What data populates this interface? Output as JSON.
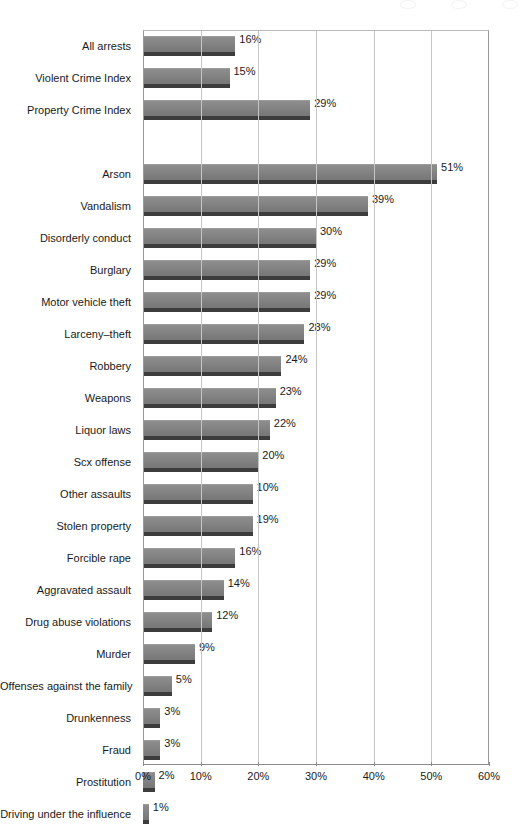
{
  "chart_data": {
    "type": "bar",
    "orientation": "horizontal",
    "title": "",
    "subtitle": "",
    "xlabel": "",
    "ylabel": "",
    "xlim": [
      0,
      60
    ],
    "xtick_labels": [
      "0%",
      "10%",
      "20%",
      "30%",
      "40%",
      "50%",
      "60%"
    ],
    "xtick_values": [
      0,
      10,
      20,
      30,
      40,
      50,
      60
    ],
    "grid": "vertical",
    "legend": "none",
    "series_name": "Percent of arrests involving juveniles",
    "bar_color": "#828282",
    "groups": [
      {
        "name": "summary",
        "categories": [
          "All arrests",
          "Violent Crime Index",
          "Property Crime Index"
        ],
        "values": [
          16,
          15,
          29
        ],
        "labels": [
          "16%",
          "15%",
          "29%"
        ]
      },
      {
        "name": "offenses",
        "categories": [
          "Arson",
          "Vandalism",
          "Disorderly conduct",
          "Burglary",
          "Motor vehicle theft",
          "Larceny–theft",
          "Robbery",
          "Weapons",
          "Liquor laws",
          "Scx offense",
          "Other assaults",
          "Stolen property",
          "Forcible rape",
          "Aggravated assault",
          "Drug abuse violations",
          "Murder",
          "Offenses against the family",
          "Drunkenness",
          "Fraud",
          "Prostitution",
          "Driving under the influence"
        ],
        "values": [
          51,
          39,
          30,
          29,
          29,
          28,
          24,
          23,
          22,
          20,
          19,
          19,
          16,
          14,
          12,
          9,
          5,
          3,
          3,
          2,
          1
        ],
        "labels": [
          "51%",
          "39%",
          "30%",
          "29%",
          "29%",
          "28%",
          "24%",
          "23%",
          "22%",
          "20%",
          "10%",
          "19%",
          "16%",
          "14%",
          "12%",
          "9%",
          "5%",
          "3%",
          "3%",
          "2%",
          "1%"
        ]
      }
    ],
    "categories": [
      "All arrests",
      "Violent Crime Index",
      "Property Crime Index",
      "Arson",
      "Vandalism",
      "Disorderly conduct",
      "Burglary",
      "Motor vehicle theft",
      "Larceny–theft",
      "Robbery",
      "Weapons",
      "Liquor laws",
      "Scx offense",
      "Other assaults",
      "Stolen property",
      "Forcible rape",
      "Aggravated assault",
      "Drug abuse violations",
      "Murder",
      "Offenses against the family",
      "Drunkenness",
      "Fraud",
      "Prostitution",
      "Driving under the influence"
    ],
    "values": [
      16,
      15,
      29,
      51,
      39,
      30,
      29,
      29,
      28,
      24,
      23,
      22,
      20,
      19,
      19,
      16,
      14,
      12,
      9,
      5,
      3,
      3,
      2,
      1
    ],
    "value_labels": [
      "16%",
      "15%",
      "29%",
      "51%",
      "39%",
      "30%",
      "29%",
      "29%",
      "28%",
      "24%",
      "23%",
      "22%",
      "20%",
      "10%",
      "19%",
      "16%",
      "14%",
      "12%",
      "9%",
      "5%",
      "3%",
      "3%",
      "2%",
      "1%"
    ]
  }
}
